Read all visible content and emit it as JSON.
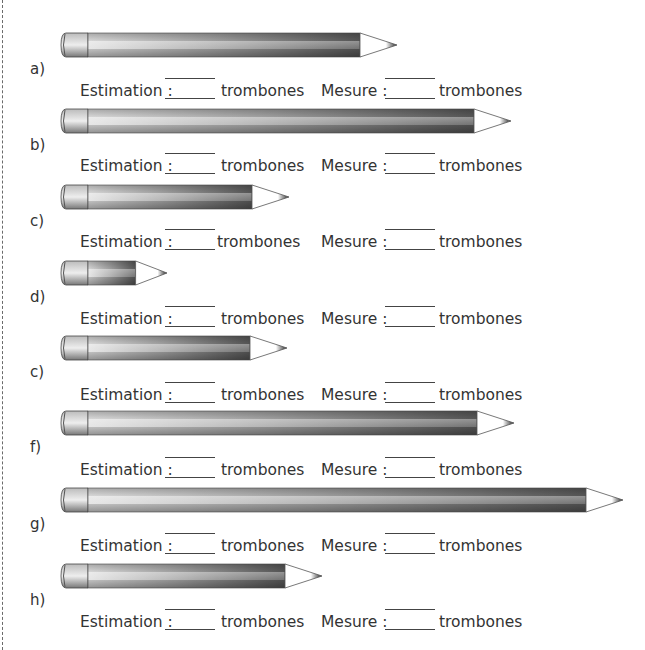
{
  "worksheet": {
    "estimation_label": "Estimation :",
    "measure_label": "Mesure :",
    "unit": "trombones",
    "colors": {
      "pencil_body_light": "#d8d8d8",
      "pencil_body_dark": "#555555",
      "pencil_tip": "#222222",
      "text": "#333333"
    },
    "items": [
      {
        "label": "a)",
        "pencil_length_px": 338,
        "estimation_value": "",
        "measure_value": ""
      },
      {
        "label": "b)",
        "pencil_length_px": 452,
        "estimation_value": "",
        "measure_value": ""
      },
      {
        "label": "c)",
        "pencil_length_px": 230,
        "estimation_value": "",
        "measure_value": ""
      },
      {
        "label": "d)",
        "pencil_length_px": 108,
        "estimation_value": "",
        "measure_value": ""
      },
      {
        "label": "c)",
        "pencil_length_px": 228,
        "estimation_value": "",
        "measure_value": ""
      },
      {
        "label": "f)",
        "pencil_length_px": 455,
        "estimation_value": "",
        "measure_value": ""
      },
      {
        "label": "g)",
        "pencil_length_px": 564,
        "estimation_value": "",
        "measure_value": ""
      },
      {
        "label": "h)",
        "pencil_length_px": 263,
        "estimation_value": "",
        "measure_value": ""
      }
    ]
  }
}
